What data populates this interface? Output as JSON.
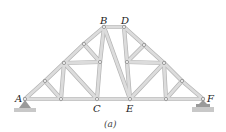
{
  "figure": {
    "caption": "(a)",
    "colors": {
      "member_fill": "#dcdcdc",
      "member_edge": "#b4b4b4",
      "node_fill": "#f2f2f2",
      "node_edge": "#8a8a8a",
      "support": "#9a9a9a",
      "ground": "#c8c8c8"
    }
  },
  "labels": {
    "A": "A",
    "B": "B",
    "C": "C",
    "D": "D",
    "E": "E",
    "F": "F"
  },
  "nodes": {
    "A": [
      25,
      99
    ],
    "b1": [
      61,
      99
    ],
    "C": [
      97,
      99
    ],
    "E": [
      130,
      99
    ],
    "b4": [
      166,
      99
    ],
    "F": [
      203,
      99
    ],
    "t1": [
      45,
      81
    ],
    "t2": [
      64,
      63
    ],
    "t3": [
      84,
      44
    ],
    "B": [
      104,
      27
    ],
    "D": [
      124,
      27
    ],
    "t4": [
      144,
      45
    ],
    "t5": [
      164,
      63
    ],
    "t6": [
      182,
      81
    ],
    "m1": [
      100,
      62
    ],
    "m2": [
      127,
      62
    ]
  },
  "members": [
    [
      "A",
      "b1"
    ],
    [
      "b1",
      "C"
    ],
    [
      "C",
      "E"
    ],
    [
      "E",
      "b4"
    ],
    [
      "b4",
      "F"
    ],
    [
      "A",
      "t1"
    ],
    [
      "t1",
      "t2"
    ],
    [
      "t2",
      "t3"
    ],
    [
      "t3",
      "B"
    ],
    [
      "B",
      "D"
    ],
    [
      "D",
      "t4"
    ],
    [
      "t4",
      "t5"
    ],
    [
      "t5",
      "t6"
    ],
    [
      "t6",
      "F"
    ],
    [
      "t1",
      "b1"
    ],
    [
      "t2",
      "b1"
    ],
    [
      "t2",
      "C"
    ],
    [
      "t2",
      "m1"
    ],
    [
      "t3",
      "m1"
    ],
    [
      "m1",
      "C"
    ],
    [
      "B",
      "m1"
    ],
    [
      "B",
      "E"
    ],
    [
      "D",
      "m2"
    ],
    [
      "m2",
      "E"
    ],
    [
      "m2",
      "t5"
    ],
    [
      "t4",
      "m2"
    ],
    [
      "t5",
      "E"
    ],
    [
      "t5",
      "b4"
    ],
    [
      "t6",
      "b4"
    ]
  ]
}
